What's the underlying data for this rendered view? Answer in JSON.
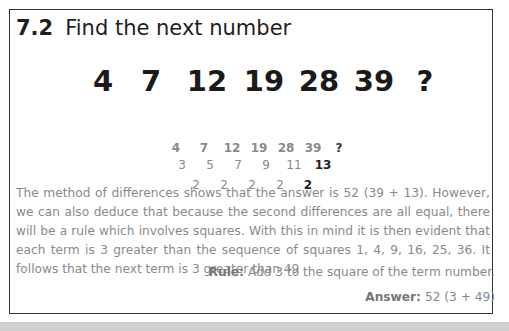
{
  "puzzle": {
    "number": "7.2",
    "title": "Find the next number",
    "big_sequence": [
      "4",
      "7",
      "12",
      "19",
      "28",
      "39",
      "?"
    ],
    "sequence": [
      "4",
      "7",
      "12",
      "19",
      "28",
      "39",
      "?"
    ],
    "first_differences": [
      "3",
      "5",
      "7",
      "9",
      "11",
      "13"
    ],
    "second_differences": [
      "2",
      "2",
      "2",
      "2",
      "2"
    ],
    "explanation": "The method of differences shows that the answer is 52 (39 + 13). However, we can also deduce that because the second differences are all equal, there will be a rule which involves squares. With this in mind it is then evident that each term is 3 greater than the sequence of squares 1, 4, 9, 16, 25, 36. It follows that the next term is 3 greater than 49",
    "rule_label": "Rule:",
    "rule_text": "Add 3 to the square of the term number.",
    "answer_label": "Answer:",
    "answer_text": "52 (3 + 49)"
  },
  "colors": {
    "border": "#333333",
    "body_text": "#8a8a8a",
    "heading_text": "#1e1e1e",
    "bottom_band": "#cfcfcf"
  }
}
